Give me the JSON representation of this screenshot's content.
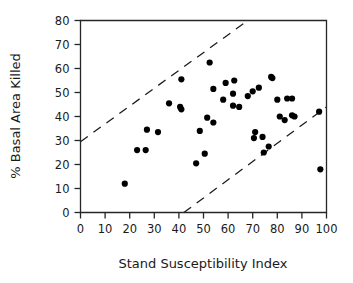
{
  "chart_data": {
    "type": "scatter",
    "title": "",
    "xlabel": "Stand Susceptibility Index",
    "ylabel": "% Basal Area Killed",
    "xlim": [
      0,
      100
    ],
    "ylim": [
      0,
      80
    ],
    "xticks": [
      0,
      10,
      20,
      30,
      40,
      50,
      60,
      70,
      80,
      90,
      100
    ],
    "yticks": [
      0,
      10,
      20,
      30,
      40,
      50,
      60,
      70,
      80
    ],
    "xtick_labels": [
      "0",
      "10",
      "20",
      "30",
      "40",
      "50",
      "60",
      "70",
      "80",
      "90",
      "100"
    ],
    "ytick_labels": [
      "0",
      "10",
      "20",
      "30",
      "40",
      "50",
      "60",
      "70",
      "80"
    ],
    "grid": false,
    "legend": false,
    "series": [
      {
        "name": "stands",
        "marker": "filled-circle",
        "color": "#000000",
        "points": [
          [
            18,
            12
          ],
          [
            23,
            26
          ],
          [
            26.5,
            26
          ],
          [
            27,
            34.5
          ],
          [
            31.5,
            33.5
          ],
          [
            36,
            45.5
          ],
          [
            40.5,
            44
          ],
          [
            41,
            43
          ],
          [
            41,
            55.5
          ],
          [
            47,
            20.5
          ],
          [
            48.5,
            34
          ],
          [
            50.5,
            24.5
          ],
          [
            51.5,
            39.5
          ],
          [
            52.5,
            62.5
          ],
          [
            54,
            37.5
          ],
          [
            54,
            51.5
          ],
          [
            58,
            47
          ],
          [
            59,
            54
          ],
          [
            62,
            49.5
          ],
          [
            62,
            44.5
          ],
          [
            62.5,
            55
          ],
          [
            64.5,
            44
          ],
          [
            68,
            48.5
          ],
          [
            70,
            50.5
          ],
          [
            70.5,
            31
          ],
          [
            71,
            33.5
          ],
          [
            72.5,
            52
          ],
          [
            74,
            31.5
          ],
          [
            74.5,
            25
          ],
          [
            76.5,
            27.5
          ],
          [
            77.5,
            56.5
          ],
          [
            78,
            56
          ],
          [
            80,
            47
          ],
          [
            81,
            40
          ],
          [
            83,
            38.5
          ],
          [
            84,
            47.5
          ],
          [
            86,
            47.5
          ],
          [
            86,
            40.5
          ],
          [
            87,
            40
          ],
          [
            97,
            42
          ],
          [
            97.5,
            18
          ]
        ]
      }
    ],
    "reference_lines": [
      {
        "name": "upper-bound",
        "style": "dashed",
        "from": [
          0,
          29.5
        ],
        "to": [
          68,
          80
        ]
      },
      {
        "name": "lower-bound",
        "style": "dashed",
        "from": [
          42,
          0
        ],
        "to": [
          100,
          44
        ]
      }
    ]
  }
}
